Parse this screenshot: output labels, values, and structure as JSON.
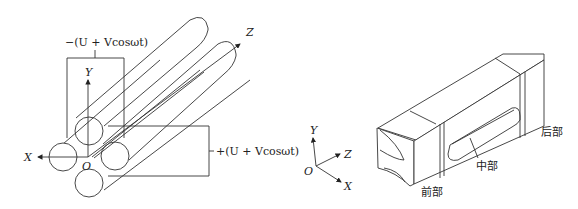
{
  "figure_left": {
    "title": "Quadrupole rod electrode arrangement",
    "voltage_top": "−(U + Vcosωt)",
    "voltage_right": "+(U + Vcosωt)",
    "axes": {
      "x": "X",
      "y": "Y",
      "z": "Z",
      "origin": "O"
    }
  },
  "figure_middle": {
    "title": "Coordinate system",
    "axes": {
      "x": "X",
      "y": "Y",
      "z": "Z",
      "origin": "O"
    }
  },
  "figure_right": {
    "title": "Segmented quadrupole electrode assembly",
    "labels": {
      "front": "前部",
      "middle": "中部",
      "back": "后部"
    }
  },
  "colors": {
    "line": "#333333",
    "background": "#ffffff"
  }
}
